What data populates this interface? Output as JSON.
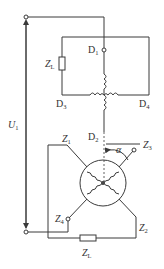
{
  "diagram": {
    "type": "circuit",
    "labels": {
      "voltage": {
        "main": "U",
        "sub": "1"
      },
      "d1": {
        "main": "D",
        "sub": "1"
      },
      "d2": {
        "main": "D",
        "sub": "2"
      },
      "d3": {
        "main": "D",
        "sub": "3"
      },
      "d4": {
        "main": "D",
        "sub": "4"
      },
      "z1": {
        "main": "Z",
        "sub": "1"
      },
      "z2": {
        "main": "Z",
        "sub": "2"
      },
      "z3": {
        "main": "Z",
        "sub": "3"
      },
      "z4": {
        "main": "Z",
        "sub": "4"
      },
      "zl_top": {
        "main": "Z",
        "sub": "L"
      },
      "zl_bottom": {
        "main": "Z",
        "sub": "L"
      },
      "angle": "α"
    },
    "colors": {
      "line": "#3a3a3a",
      "text": "#333333",
      "background": "#ffffff"
    }
  }
}
